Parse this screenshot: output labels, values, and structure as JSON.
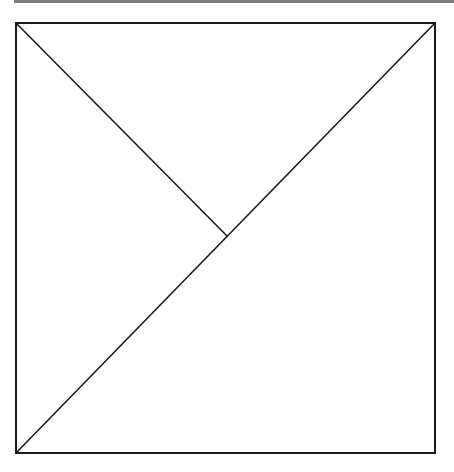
{
  "diagram": {
    "type": "geometric-figure",
    "stroke_color": "#1a1a1a",
    "top_rule_color": "#7a7a7a",
    "square": {
      "x1": 16,
      "y1": 23,
      "x2": 435,
      "y2": 453
    },
    "segments": [
      {
        "name": "full-diagonal",
        "from": [
          16,
          453
        ],
        "to": [
          435,
          23
        ]
      },
      {
        "name": "half-diagonal",
        "from": [
          16,
          23
        ],
        "to": [
          227,
          236
        ]
      }
    ],
    "labels": []
  }
}
